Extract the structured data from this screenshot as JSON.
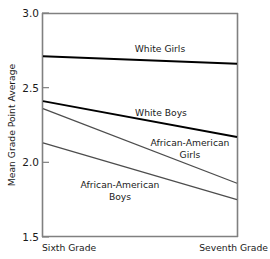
{
  "chart_data": {
    "type": "line",
    "title": "",
    "xlabel": "",
    "ylabel": "Mean Grade Point Average",
    "categories": [
      "Sixth Grade",
      "Seventh Grade"
    ],
    "x": [
      0,
      1
    ],
    "ylim": [
      1.5,
      3.0
    ],
    "yticks": [
      "1.5",
      "2.0",
      "2.5",
      "3.0"
    ],
    "ytick_values": [
      1.5,
      2.0,
      2.5,
      3.0
    ],
    "grid": false,
    "legend_position": "inline-annotations",
    "series": [
      {
        "name": "White Girls",
        "values": [
          2.71,
          2.66
        ],
        "color": "#000000",
        "width": 1.9,
        "label": "White Girls",
        "label_x": 160,
        "label_y": 54
      },
      {
        "name": "White Boys",
        "values": [
          2.41,
          2.17
        ],
        "color": "#000000",
        "width": 1.9,
        "label": "White Boys",
        "label_x": 161,
        "label_y": 117
      },
      {
        "name": "African-American Girls",
        "values": [
          2.36,
          1.86
        ],
        "color": "#4d4d4d",
        "width": 1.3,
        "label": "African-American",
        "label2": "Girls",
        "label_x": 188,
        "label_y": 146,
        "label2_y": 158
      },
      {
        "name": "African-American Boys",
        "values": [
          2.13,
          1.75
        ],
        "color": "#4d4d4d",
        "width": 1.3,
        "label": "African-American",
        "label2": "Boys",
        "label_x": 119,
        "label_y": 188,
        "label2_y": 200
      }
    ],
    "axis_color": "#808080",
    "plot_box": {
      "left": 42,
      "top": 13,
      "right": 238,
      "bottom": 237
    }
  }
}
